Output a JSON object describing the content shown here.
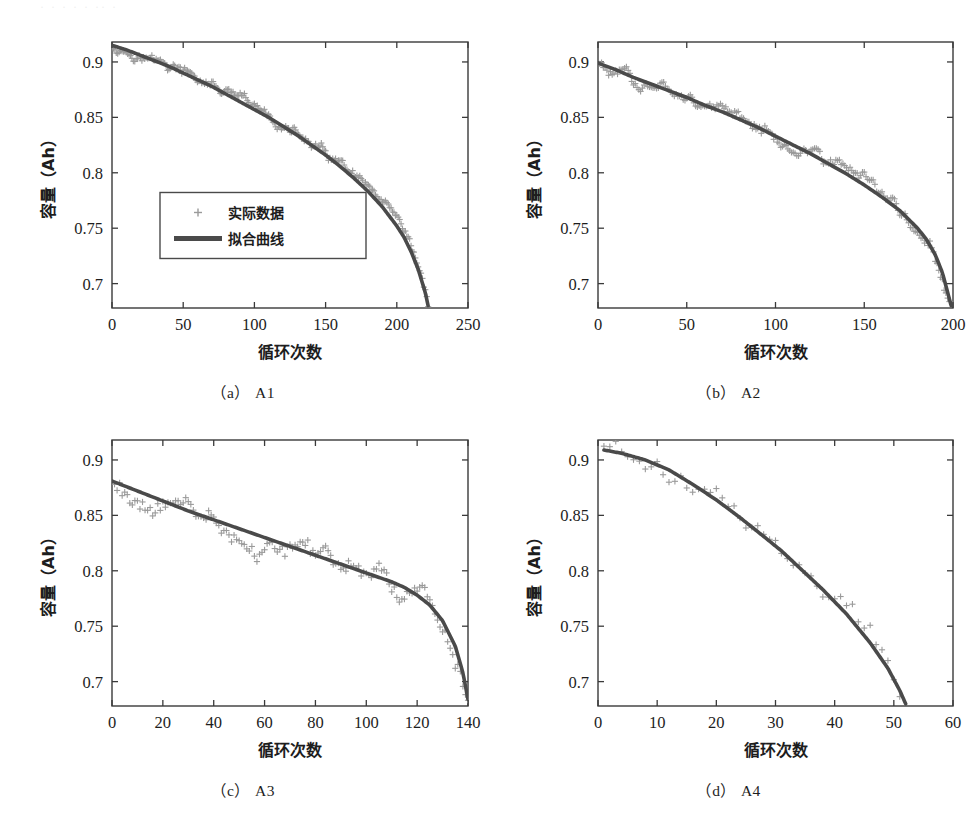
{
  "figure": {
    "scan_artifact_text": "· · ·  · ·   ·· ·",
    "axis_labels": {
      "x": "循环次数",
      "y": "容量（Ah）"
    },
    "legend": {
      "scatter_label": "实际数据",
      "line_label": "拟合曲线",
      "marker_icon": "plus-marker-icon",
      "line_icon": "thick-line-icon"
    },
    "colors": {
      "scatter": "#9a9a9a",
      "fit_line": "#4a4a4a",
      "axis": "#3a3a3a",
      "text": "#1d1d1d",
      "background": "#ffffff"
    },
    "captions": [
      {
        "paren": "（a）",
        "id": "A1"
      },
      {
        "paren": "（b）",
        "id": "A2"
      },
      {
        "paren": "（c）",
        "id": "A3"
      },
      {
        "paren": "（d）",
        "id": "A4"
      }
    ]
  },
  "chart_data": [
    {
      "type": "scatter",
      "panel": "a",
      "title": "（a）A1",
      "xlabel": "循环次数",
      "ylabel": "容量（Ah）",
      "xlim": [
        0,
        250
      ],
      "ylim": [
        0.678,
        0.918
      ],
      "xticks": [
        0,
        50,
        100,
        150,
        200,
        250
      ],
      "yticks": [
        0.7,
        0.75,
        0.8,
        0.85,
        0.9
      ],
      "grid": false,
      "legend": "inside-left",
      "series": [
        {
          "name": "实际数据",
          "kind": "scatter",
          "marker": "+",
          "color": "#9a9a9a",
          "n_points": 222,
          "x_range": [
            1,
            222
          ],
          "noise_amplitude": 0.004
        },
        {
          "name": "拟合曲线",
          "kind": "line",
          "color": "#4a4a4a",
          "x": [
            0,
            10,
            20,
            30,
            40,
            50,
            60,
            70,
            80,
            90,
            100,
            110,
            120,
            130,
            140,
            150,
            160,
            170,
            180,
            190,
            200,
            205,
            210,
            215,
            220,
            222
          ],
          "y": [
            0.915,
            0.911,
            0.906,
            0.901,
            0.896,
            0.89,
            0.884,
            0.878,
            0.871,
            0.864,
            0.857,
            0.85,
            0.842,
            0.834,
            0.825,
            0.816,
            0.806,
            0.795,
            0.783,
            0.769,
            0.752,
            0.742,
            0.729,
            0.713,
            0.692,
            0.68
          ]
        }
      ]
    },
    {
      "type": "scatter",
      "panel": "b",
      "title": "（b）A2",
      "xlabel": "循环次数",
      "ylabel": "容量（Ah）",
      "xlim": [
        0,
        200
      ],
      "ylim": [
        0.678,
        0.918
      ],
      "xticks": [
        0,
        50,
        100,
        150,
        200
      ],
      "yticks": [
        0.7,
        0.75,
        0.8,
        0.85,
        0.9
      ],
      "grid": false,
      "legend": "none",
      "series": [
        {
          "name": "实际数据",
          "kind": "scatter",
          "marker": "+",
          "color": "#9a9a9a",
          "n_points": 198,
          "x_range": [
            1,
            198
          ],
          "noise_amplitude": 0.005
        },
        {
          "name": "拟合曲线",
          "kind": "line",
          "color": "#4a4a4a",
          "x": [
            0,
            10,
            20,
            30,
            40,
            50,
            60,
            70,
            80,
            90,
            100,
            110,
            120,
            130,
            140,
            150,
            160,
            170,
            180,
            185,
            190,
            194,
            197,
            199
          ],
          "y": [
            0.899,
            0.893,
            0.886,
            0.88,
            0.874,
            0.868,
            0.861,
            0.855,
            0.848,
            0.841,
            0.833,
            0.825,
            0.817,
            0.808,
            0.799,
            0.789,
            0.778,
            0.766,
            0.75,
            0.74,
            0.726,
            0.71,
            0.692,
            0.68
          ]
        }
      ]
    },
    {
      "type": "scatter",
      "panel": "c",
      "title": "（c）A3",
      "xlabel": "循环次数",
      "ylabel": "容量（Ah）",
      "xlim": [
        0,
        140
      ],
      "ylim": [
        0.678,
        0.918
      ],
      "xticks": [
        0,
        20,
        40,
        60,
        80,
        100,
        120,
        140
      ],
      "yticks": [
        0.7,
        0.75,
        0.8,
        0.85,
        0.9
      ],
      "grid": false,
      "legend": "none",
      "series": [
        {
          "name": "实际数据",
          "kind": "scatter",
          "marker": "+",
          "color": "#9a9a9a",
          "n_points": 140,
          "x_range": [
            1,
            140
          ],
          "noise_amplitude": 0.01
        },
        {
          "name": "拟合曲线",
          "kind": "line",
          "color": "#4a4a4a",
          "x": [
            0,
            10,
            20,
            30,
            40,
            50,
            60,
            70,
            80,
            90,
            100,
            110,
            115,
            120,
            125,
            130,
            135,
            138,
            140
          ],
          "y": [
            0.881,
            0.872,
            0.863,
            0.854,
            0.846,
            0.838,
            0.83,
            0.822,
            0.814,
            0.806,
            0.798,
            0.79,
            0.785,
            0.778,
            0.769,
            0.755,
            0.732,
            0.708,
            0.684
          ]
        }
      ]
    },
    {
      "type": "scatter",
      "panel": "d",
      "title": "（d）A4",
      "xlabel": "循环次数",
      "ylabel": "容量（Ah）",
      "xlim": [
        0,
        60
      ],
      "ylim": [
        0.678,
        0.918
      ],
      "xticks": [
        0,
        10,
        20,
        30,
        40,
        50,
        60
      ],
      "yticks": [
        0.7,
        0.75,
        0.8,
        0.85,
        0.9
      ],
      "grid": false,
      "legend": "none",
      "series": [
        {
          "name": "实际数据",
          "kind": "scatter",
          "marker": "+",
          "color": "#9a9a9a",
          "n_points": 52,
          "x_range": [
            1,
            52
          ],
          "noise_amplitude": 0.009
        },
        {
          "name": "拟合曲线",
          "kind": "line",
          "color": "#4a4a4a",
          "x": [
            1,
            4,
            8,
            12,
            16,
            20,
            24,
            28,
            31,
            34,
            38,
            42,
            46,
            49,
            51,
            52
          ],
          "y": [
            0.909,
            0.906,
            0.9,
            0.891,
            0.878,
            0.864,
            0.848,
            0.831,
            0.818,
            0.803,
            0.783,
            0.761,
            0.735,
            0.712,
            0.692,
            0.68
          ]
        }
      ]
    }
  ]
}
